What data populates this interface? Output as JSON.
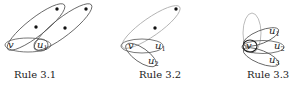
{
  "figures": [
    {
      "id": "rule-3-1",
      "caption": "Rule 3.1",
      "labels": {
        "v": "v",
        "u1": "u",
        "u1_sub": "1"
      }
    },
    {
      "id": "rule-3-2",
      "caption": "Rule 3.2",
      "labels": {
        "v": "v",
        "u1": "u",
        "u1_sub": "1",
        "u2": "u",
        "u2_sub": "2"
      }
    },
    {
      "id": "rule-3-3",
      "caption": "Rule 3.3",
      "labels": {
        "v": "v",
        "u1": "u",
        "u1_sub": "1",
        "u2": "u",
        "u2_sub": "2",
        "u3": "u",
        "u3_sub": "3"
      }
    }
  ]
}
